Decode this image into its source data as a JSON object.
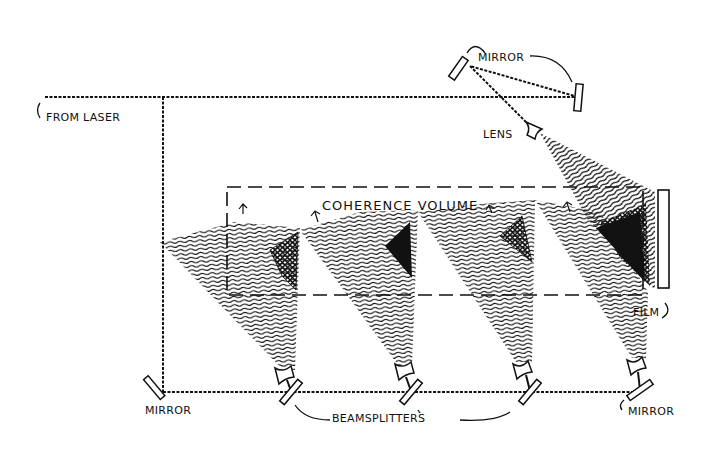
{
  "diagram": {
    "type": "optical-setup",
    "labels": {
      "from_laser": "FROM LASER",
      "mirror_top": "MIRROR",
      "lens": "LENS",
      "coherence_volume": "COHERENCE VOLUME",
      "film": "FILM",
      "mirror_bottom_left": "MIRROR",
      "beamsplitters": "BEAMSPLITTERS",
      "mirror_bottom_right": "MIRROR"
    },
    "components": [
      {
        "id": "laser-input",
        "kind": "beam-source",
        "label_ref": "from_laser"
      },
      {
        "id": "mirror-top-left",
        "kind": "mirror"
      },
      {
        "id": "mirror-top-right",
        "kind": "mirror"
      },
      {
        "id": "lens-reference",
        "kind": "diverging-lens"
      },
      {
        "id": "mirror-bottom-left",
        "kind": "mirror"
      },
      {
        "id": "beamsplitter-1",
        "kind": "beamsplitter"
      },
      {
        "id": "beamsplitter-2",
        "kind": "beamsplitter"
      },
      {
        "id": "beamsplitter-3",
        "kind": "beamsplitter"
      },
      {
        "id": "mirror-bottom-right",
        "kind": "mirror"
      },
      {
        "id": "lens-1",
        "kind": "diverging-lens"
      },
      {
        "id": "lens-2",
        "kind": "diverging-lens"
      },
      {
        "id": "lens-3",
        "kind": "diverging-lens"
      },
      {
        "id": "lens-4",
        "kind": "diverging-lens"
      },
      {
        "id": "film-plate",
        "kind": "film"
      },
      {
        "id": "coherence-volume",
        "kind": "region"
      }
    ],
    "colors": {
      "ink": "#111111",
      "background": "#ffffff"
    }
  }
}
